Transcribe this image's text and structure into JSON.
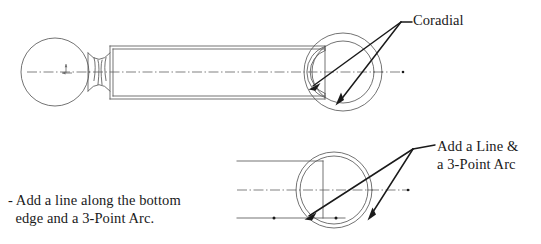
{
  "document": {
    "title": "Coradial Arc Construction Exercise",
    "background_color": "#ffffff",
    "line_color": "#3a3a3a",
    "leader_color": "#1a1a1a",
    "centerline_color": "#6b6b6b",
    "width": 541,
    "height": 244
  },
  "annotations": {
    "coradial": {
      "label": "Coradial",
      "x": 413,
      "y": 12,
      "leader_vertex_x": 401,
      "leader_vertex_y": 22,
      "arrow_targets": [
        {
          "x": 310,
          "y": 88
        },
        {
          "x": 337,
          "y": 103
        }
      ]
    },
    "add_line_arc": {
      "line_1": "Add a Line &",
      "line_2": "a 3-Point Arc",
      "x": 437,
      "y": 138,
      "leader_vertex_x": 413,
      "leader_vertex_y": 149,
      "arrow_targets": [
        {
          "x": 306,
          "y": 219
        },
        {
          "x": 368,
          "y": 218
        }
      ]
    },
    "bottom_note": {
      "line_1": "- Add a line along the bottom",
      "line_2": "  edge and a 3-Point Arc.",
      "x": 8,
      "y": 192
    }
  },
  "upper_view": {
    "name": "ball-pin-side-view",
    "centerline": {
      "x1": 27,
      "y1": 72,
      "x2": 405,
      "y2": 72
    },
    "centerline_end_dot": {
      "x": 403,
      "y": 72,
      "r": 1.3
    },
    "ball": {
      "cx": 55,
      "cy": 72,
      "r": 34
    },
    "ball_origin_mark": {
      "x": 66,
      "y": 72
    },
    "neck": {
      "left_x": 88,
      "right_x": 110,
      "top_y": 53,
      "bottom_y": 91,
      "rib_xs": [
        94,
        98,
        102,
        106
      ]
    },
    "shaft": {
      "left_x": 110,
      "right_x": 325,
      "top_y": 46,
      "bottom_y": 99,
      "inner_top_y": 49,
      "inner_bottom_y": 96
    },
    "end_circles": {
      "cx": 343,
      "cy": 72,
      "outer_r": 39,
      "inner_r": 31
    },
    "end_crescent": {
      "outer_r": 27,
      "inner_r": 23,
      "cx": 329,
      "cy": 72
    }
  },
  "lower_view": {
    "name": "end-detail-view",
    "centerline": {
      "x1": 237,
      "y1": 190,
      "x2": 410,
      "y2": 190
    },
    "centerline_end_dot": {
      "x": 408,
      "y": 190,
      "r": 1.3
    },
    "top_edge_line": {
      "x1": 237,
      "y1": 161,
      "x2": 323,
      "y2": 161
    },
    "bottom_edge_line": {
      "x1": 237,
      "y1": 218,
      "x2": 345,
      "y2": 218
    },
    "vertical_edge_line": {
      "x": 323,
      "y1": 161,
      "y2": 218
    },
    "circles": {
      "cx": 334,
      "cy": 190,
      "outer_r": 38,
      "inner_r": 34
    },
    "dots": [
      {
        "x": 274,
        "y": 218,
        "r": 1.5
      },
      {
        "x": 336,
        "y": 218,
        "r": 1.5
      }
    ]
  },
  "icons": {
    "origin": "origin-axis-mark",
    "arrow": "arrowhead-icon"
  }
}
